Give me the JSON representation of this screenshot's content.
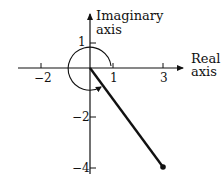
{
  "diagram": {
    "type": "complex-plane",
    "axes": {
      "real_label_line1": "Real",
      "real_label_line2": "axis",
      "imag_label_line1": "Imaginary",
      "imag_label_line2": "axis"
    },
    "ticks": {
      "real": [
        {
          "value": -2,
          "label": "−2"
        },
        {
          "value": 1,
          "label": "1"
        },
        {
          "value": 3,
          "label": "3"
        }
      ],
      "imag": [
        {
          "value": 1,
          "label": "1"
        },
        {
          "value": -2,
          "label": "−2"
        },
        {
          "value": -4,
          "label": "−4"
        }
      ]
    },
    "vector": {
      "from": [
        0,
        0
      ],
      "to": [
        3,
        -4
      ],
      "color": "#111111"
    },
    "angle_arc": {
      "direction": "counterclockwise",
      "arrowhead": true
    },
    "colors": {
      "ink": "#111111",
      "background": "#ffffff"
    }
  }
}
